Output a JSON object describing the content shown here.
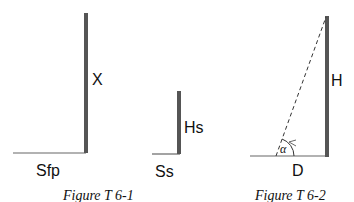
{
  "figures": [
    {
      "caption": "Figure T 6-1",
      "left_diagram": {
        "vertical_label": "X",
        "horizontal_label": "Sfp"
      },
      "right_diagram": {
        "vertical_label": "Hs",
        "horizontal_label": "Ss"
      }
    },
    {
      "caption": "Figure T 6-2",
      "vertical_label": "H",
      "horizontal_label": "D",
      "angle_label": "α",
      "sightline_style": "dashed"
    }
  ],
  "colors": {
    "pole": "#555555",
    "ground": "#666666",
    "text": "#111111",
    "background": "#ffffff"
  }
}
